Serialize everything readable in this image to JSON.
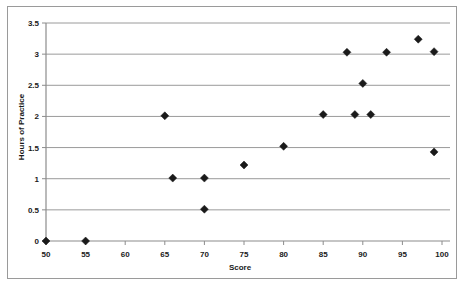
{
  "chart_data": {
    "type": "scatter",
    "title": "",
    "xlabel": "Score",
    "ylabel": "Hours of Practice",
    "xlim": [
      50,
      100
    ],
    "ylim": [
      0,
      3.5
    ],
    "xticks": [
      50,
      55,
      60,
      65,
      70,
      75,
      80,
      85,
      90,
      95,
      100
    ],
    "xtick_labels": [
      "50",
      "55",
      "60",
      "65",
      "70",
      "75",
      "80",
      "85",
      "90",
      "95",
      "100"
    ],
    "yticks": [
      0,
      0.5,
      1,
      1.5,
      2,
      2.5,
      3,
      3.5
    ],
    "ytick_labels": [
      "0",
      "0.5",
      "1",
      "1.5",
      "2",
      "2.5",
      "3",
      "3.5"
    ],
    "grid": "horizontal",
    "legend": "none",
    "marker": "diamond",
    "marker_color": "#1a1a1a",
    "points": [
      {
        "x": 50,
        "y": 0
      },
      {
        "x": 55,
        "y": 0
      },
      {
        "x": 65,
        "y": 2.01
      },
      {
        "x": 66,
        "y": 1.01
      },
      {
        "x": 70,
        "y": 1.01
      },
      {
        "x": 70,
        "y": 0.51
      },
      {
        "x": 75,
        "y": 1.22
      },
      {
        "x": 80,
        "y": 1.52
      },
      {
        "x": 85,
        "y": 2.03
      },
      {
        "x": 88,
        "y": 3.03
      },
      {
        "x": 89,
        "y": 2.03
      },
      {
        "x": 90,
        "y": 2.53
      },
      {
        "x": 91,
        "y": 2.03
      },
      {
        "x": 93,
        "y": 3.03
      },
      {
        "x": 97,
        "y": 3.24
      },
      {
        "x": 99,
        "y": 3.04
      },
      {
        "x": 99,
        "y": 1.43
      }
    ]
  },
  "frame": {
    "border_color": "#9a9a9a",
    "background": "#ffffff"
  }
}
